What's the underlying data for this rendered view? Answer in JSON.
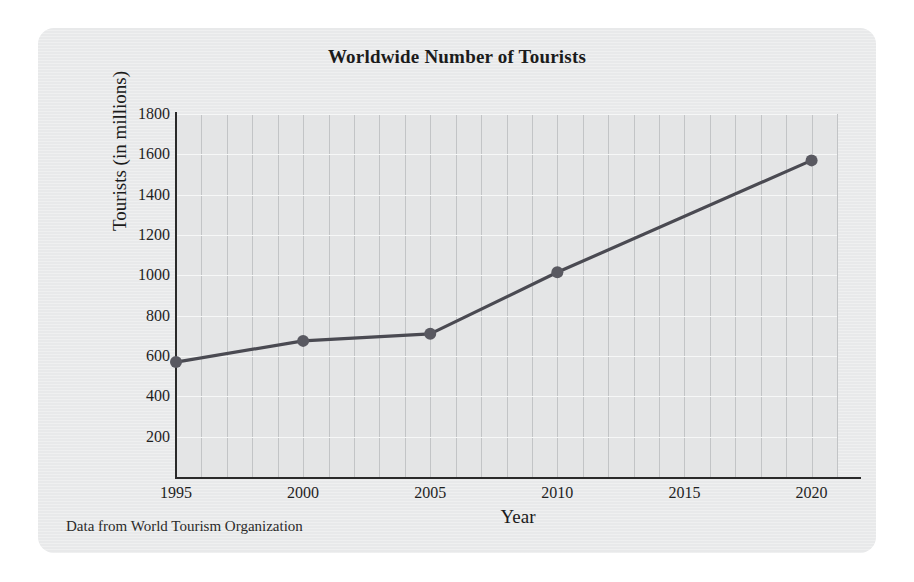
{
  "card": {
    "source_note": "Data from World Tourism Organization"
  },
  "chart_data": {
    "type": "line",
    "title": "Worldwide Number of Tourists",
    "xlabel": "Year",
    "ylabel": "Tourists (in millions)",
    "x": [
      1995,
      2000,
      2005,
      2010,
      2020
    ],
    "values": [
      570,
      675,
      710,
      1015,
      1570
    ],
    "series": [
      {
        "name": "Worldwide tourists",
        "x": [
          1995,
          2000,
          2005,
          2010,
          2020
        ],
        "values": [
          570,
          675,
          710,
          1015,
          1570
        ]
      }
    ],
    "xlim": [
      1995,
      2021
    ],
    "ylim": [
      0,
      1800
    ],
    "xticks": [
      1995,
      2000,
      2005,
      2010,
      2015,
      2020
    ],
    "xtick_labels": [
      "1995",
      "2000",
      "2005",
      "2010",
      "2015",
      "2020"
    ],
    "yticks": [
      200,
      400,
      600,
      800,
      1000,
      1200,
      1400,
      1600,
      1800
    ],
    "ytick_labels": [
      "200",
      "400",
      "600",
      "800",
      "1000",
      "1200",
      "1400",
      "1600",
      "1800"
    ],
    "grid": {
      "vertical": true,
      "vertical_step": 1,
      "vertical_color": "#c2c4c6",
      "horizontal": true,
      "horizontal_step": 200,
      "horizontal_color": "#f6f7f7"
    },
    "legend": "none",
    "line_color": "#4a4a52",
    "marker_color": "#595961",
    "marker": "circle",
    "plot_background": "#e4e5e6"
  }
}
